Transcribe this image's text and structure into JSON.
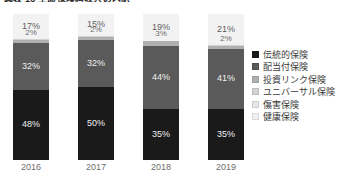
{
  "caption": "図表 13  生命保険料収入の内訳",
  "chart_data": {
    "type": "bar",
    "stacked": true,
    "stack_mode": "percent",
    "title": "図表 13  生命保険料収入の内訳",
    "xlabel": "",
    "ylabel": "",
    "ylim": [
      0,
      100
    ],
    "grid": false,
    "legend_position": "right",
    "value_suffix": "%",
    "categories": [
      "2016",
      "2017",
      "2018",
      "2019"
    ],
    "series": [
      {
        "name": "伝統的保険",
        "color": "#1a1a1a",
        "values": [
          48,
          50,
          35,
          35
        ],
        "labels": [
          "48%",
          "50%",
          "35%",
          "35%"
        ]
      },
      {
        "name": "配当付保険",
        "color": "#5a5a5a",
        "values": [
          32,
          32,
          44,
          41
        ],
        "labels": [
          "32%",
          "32%",
          "44%",
          "41%"
        ]
      },
      {
        "name": "投資リンク保険",
        "color": "#b0b0b0",
        "values": [
          2,
          2,
          3,
          2
        ],
        "labels": [
          "2%",
          "2%",
          "3%",
          "2%"
        ]
      },
      {
        "name": "ユニバーサル保険",
        "color": "#d2d2d2",
        "values": [
          1,
          1,
          0,
          1
        ],
        "labels": [
          "",
          "",
          "",
          ""
        ]
      },
      {
        "name": "傷害保険",
        "color": "#e6e6e6",
        "values": [
          0,
          0,
          0,
          0
        ],
        "labels": [
          "",
          "",
          "",
          ""
        ]
      },
      {
        "name": "健康保険",
        "color": "#f2f2f2",
        "values": [
          17,
          15,
          19,
          21
        ],
        "labels": [
          "17%",
          "15%",
          "19%",
          "21%"
        ]
      }
    ]
  },
  "legend": {
    "items": [
      {
        "label": "伝統的保険",
        "color": "#1a1a1a"
      },
      {
        "label": "配当付保険",
        "color": "#5a5a5a"
      },
      {
        "label": "投資リンク保険",
        "color": "#b0b0b0"
      },
      {
        "label": "ユニバーサル保険",
        "color": "#d2d2d2"
      },
      {
        "label": "傷害保険",
        "color": "#e6e6e6"
      },
      {
        "label": "健康保険",
        "color": "#f2f2f2"
      }
    ]
  }
}
